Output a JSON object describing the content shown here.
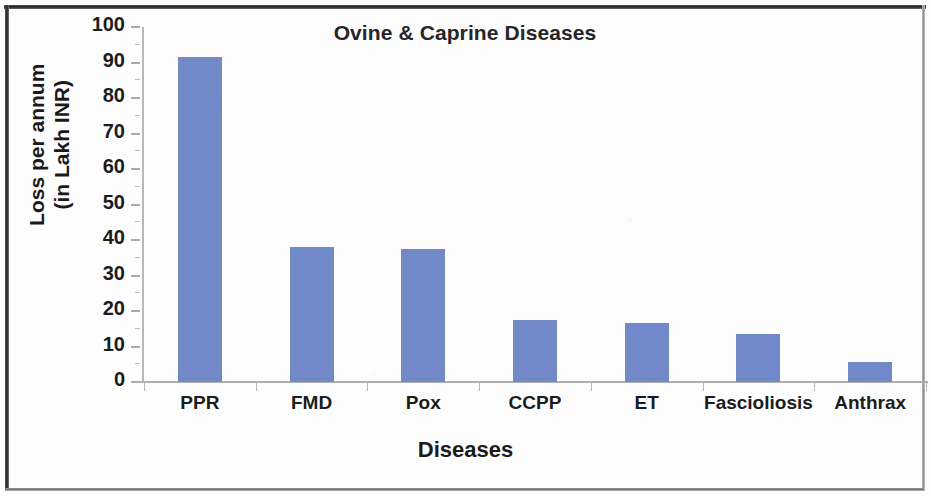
{
  "chart_data": {
    "type": "bar",
    "title": "Ovine & Caprine Diseases",
    "xlabel": "Diseases",
    "ylabel": "Loss per annum\n(in Lakh INR)",
    "ylabel_line1": "Loss per annum",
    "ylabel_line2": "(in Lakh INR)",
    "categories": [
      "PPR",
      "FMD",
      "Pox",
      "CCPP",
      "ET",
      "Fascioliosis",
      "Anthrax"
    ],
    "values": [
      91.5,
      38,
      37.5,
      17.5,
      16.5,
      13.5,
      5.5
    ],
    "ylim": [
      0,
      100
    ],
    "ytick_values": [
      0,
      10,
      20,
      30,
      40,
      50,
      60,
      70,
      80,
      90,
      100
    ],
    "ytick_labels": [
      "0",
      "10",
      "20",
      "30",
      "40",
      "50",
      "60",
      "70",
      "80",
      "90",
      "100"
    ],
    "grid": false,
    "legend": null,
    "bar_color": "#7189c8",
    "axis_color": "#b0b0b0",
    "text_color": "#1c1c1c"
  },
  "figure": {
    "border_color": "#212121",
    "background": "#fdfdfd",
    "width": 931,
    "height": 496
  }
}
